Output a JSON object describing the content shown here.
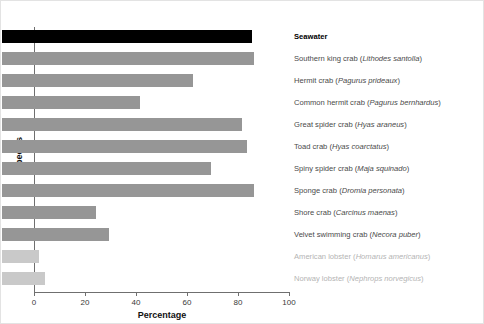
{
  "axes": {
    "x_title": "Percentage",
    "y_title": "Species",
    "x_ticks": [
      "0",
      "20",
      "40",
      "60",
      "80",
      "100"
    ]
  },
  "colors": {
    "bar_default": "#969696",
    "bar_highlight": "#000000",
    "bar_faded": "#c9c9c9",
    "label_default": "#4a4a4a",
    "label_faded": "#b4b4b4",
    "axis": "#6f6f6f"
  },
  "labels": {
    "r0": "Seawater",
    "r1_common": "Southern king crab (",
    "r1_sci": "Lithodes santolla",
    "r1_end": ")",
    "r2_common": "Hermit crab (",
    "r2_sci": "Pagurus prideaux",
    "r2_end": ")",
    "r3_common": "Common hermit crab (",
    "r3_sci": "Pagurus bernhardus",
    "r3_end": ")",
    "r4_common": "Great spider crab (",
    "r4_sci": "Hyas araneus",
    "r4_end": ")",
    "r5_common": "Toad crab (",
    "r5_sci": "Hyas coarctatus",
    "r5_end": ")",
    "r6_common": "Spiny spider crab (",
    "r6_sci": "Maja squinado",
    "r6_end": ")",
    "r7_common": "Sponge crab (",
    "r7_sci": "Dromia personata",
    "r7_end": ")",
    "r8_common": "Shore crab (",
    "r8_sci": "Carcinus maenas",
    "r8_end": ")",
    "r9_common": "Velvet swimming crab (",
    "r9_sci": "Necora puber",
    "r9_end": ")",
    "r10_common": "American lobster (",
    "r10_sci": "Homarus americanus",
    "r10_end": ")",
    "r11_common": "Norway lobster (",
    "r11_sci": "Nephrops norvegicus",
    "r11_end": ")"
  },
  "chart_data": {
    "type": "bar",
    "orientation": "horizontal",
    "title": "",
    "xlabel": "Percentage",
    "ylabel": "Species",
    "xlim": [
      0,
      100
    ],
    "xticks": [
      0,
      20,
      40,
      60,
      80,
      100
    ],
    "grid": false,
    "legend": "none",
    "categories": [
      "Seawater",
      "Southern king crab (Lithodes santolla)",
      "Hermit crab (Pagurus prideaux)",
      "Common hermit crab (Pagurus bernhardus)",
      "Great spider crab (Hyas araneus)",
      "Toad crab (Hyas coarctatus)",
      "Spiny spider crab (Maja squinado)",
      "Sponge crab (Dromia personata)",
      "Shore crab (Carcinus maenas)",
      "Velvet swimming crab (Necora puber)",
      "American lobster (Homarus americanus)",
      "Norway lobster (Nephrops norvegicus)"
    ],
    "values": [
      98,
      99,
      75,
      54,
      94,
      96,
      82,
      99,
      37,
      42,
      14.5,
      17
    ],
    "bar_colors": [
      "#000000",
      "#969696",
      "#969696",
      "#969696",
      "#969696",
      "#969696",
      "#969696",
      "#969696",
      "#969696",
      "#969696",
      "#c9c9c9",
      "#c9c9c9"
    ]
  }
}
